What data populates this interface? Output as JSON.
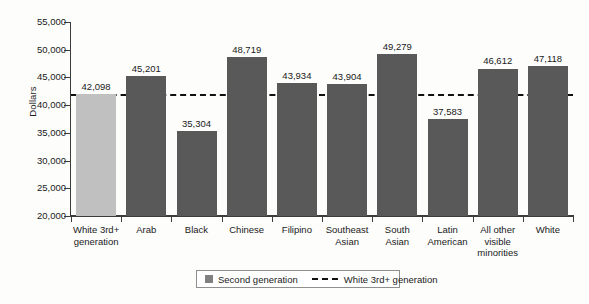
{
  "chart_data": {
    "type": "bar",
    "title": "",
    "xlabel": "",
    "ylabel": "Dollars",
    "ylim": [
      20000,
      55000
    ],
    "ytick_step": 5000,
    "ytick_labels": [
      "20,000",
      "25,000",
      "30,000",
      "35,000",
      "40,000",
      "45,000",
      "50,000",
      "55,000"
    ],
    "ytick_values": [
      20000,
      25000,
      30000,
      35000,
      40000,
      45000,
      50000,
      55000
    ],
    "grid": false,
    "legend_position": "bottom-center",
    "categories": [
      "White 3rd+ generation",
      "Arab",
      "Black",
      "Chinese",
      "Filipino",
      "Southeast Asian",
      "South Asian",
      "Latin American",
      "All other visible minorities",
      "White"
    ],
    "category_lines": [
      [
        "White 3rd+",
        "generation"
      ],
      [
        "Arab"
      ],
      [
        "Black"
      ],
      [
        "Chinese"
      ],
      [
        "Filipino"
      ],
      [
        "Southeast",
        "Asian"
      ],
      [
        "South",
        "Asian"
      ],
      [
        "Latin",
        "American"
      ],
      [
        "All other",
        "visible",
        "minorities"
      ],
      [
        "White"
      ]
    ],
    "values": [
      42098,
      45201,
      35304,
      48719,
      43934,
      43904,
      49279,
      37583,
      46612,
      47118
    ],
    "value_labels": [
      "42,098",
      "45,201",
      "35,304",
      "48,719",
      "43,934",
      "43,904",
      "49,279",
      "37,583",
      "46,612",
      "47,118"
    ],
    "bar_colors": [
      "#c0c0c0",
      "#595959",
      "#595959",
      "#595959",
      "#595959",
      "#595959",
      "#595959",
      "#595959",
      "#595959",
      "#595959"
    ],
    "reference_line": {
      "label": "White 3rd+ generation",
      "value": 42098,
      "style": "dashed",
      "color": "#111111"
    },
    "series": [
      {
        "name": "Second generation",
        "color": "#595959",
        "values": [
          null,
          45201,
          35304,
          48719,
          43934,
          43904,
          49279,
          37583,
          46612,
          47118
        ]
      },
      {
        "name": "White 3rd+ generation",
        "color": "#c0c0c0",
        "values": [
          42098,
          null,
          null,
          null,
          null,
          null,
          null,
          null,
          null,
          null
        ]
      }
    ]
  },
  "legend": {
    "items": [
      {
        "label": "Second generation",
        "marker": "swatch",
        "color": "#595959"
      },
      {
        "label": "White 3rd+ generation",
        "marker": "dashed-line",
        "color": "#111111"
      }
    ]
  }
}
